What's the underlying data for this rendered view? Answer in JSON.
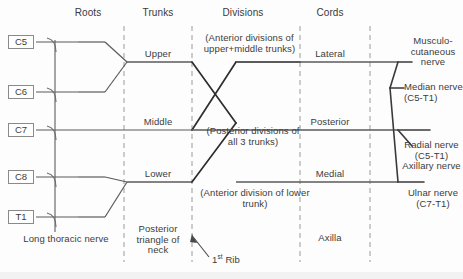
{
  "diagram": {
    "columns": [
      {
        "id": "roots",
        "label": "Roots",
        "x": 88
      },
      {
        "id": "trunks",
        "label": "Trunks",
        "x": 158
      },
      {
        "id": "divisions",
        "label": "Divisions",
        "x": 243
      },
      {
        "id": "cords",
        "label": "Cords",
        "x": 330
      }
    ],
    "roots": [
      {
        "label": "C5",
        "y": 35
      },
      {
        "label": "C6",
        "y": 85
      },
      {
        "label": "C7",
        "y": 123
      },
      {
        "label": "C8",
        "y": 170
      },
      {
        "label": "T1",
        "y": 210
      }
    ],
    "trunks": [
      {
        "label": "Upper",
        "x": 158,
        "y": 62
      },
      {
        "label": "Middle",
        "x": 158,
        "y": 123
      },
      {
        "label": "Lower",
        "x": 158,
        "y": 182
      }
    ],
    "cords": [
      {
        "label": "Lateral",
        "x": 330,
        "y": 62
      },
      {
        "label": "Posterior",
        "x": 330,
        "y": 123
      },
      {
        "label": "Medial",
        "x": 330,
        "y": 182
      }
    ],
    "division_notes": [
      {
        "id": "anterior-upper-middle",
        "text": "(Anterior divisions of upper+middle trunks)",
        "x": 247,
        "y": 38
      },
      {
        "id": "posterior-all-three",
        "text": "(Posterior divisions of all 3 trunks)",
        "x": 253,
        "y": 128
      },
      {
        "id": "anterior-lower",
        "text": "(Anterior division of lower trunk)",
        "x": 253,
        "y": 190
      }
    ],
    "terminal_nerves": [
      {
        "id": "musculocutaneous",
        "text": "Musculo-cutaneous nerve",
        "x": 429,
        "y": 40
      },
      {
        "id": "median",
        "text": "Median nerve (C5-T1)",
        "x": 429,
        "y": 84
      },
      {
        "id": "radial-axillary",
        "text": "Radial nerve (C5-T1) Axillary nerve",
        "x": 429,
        "y": 140
      },
      {
        "id": "ulnar",
        "text": "Ulnar nerve (C7-T1)",
        "x": 429,
        "y": 190
      }
    ],
    "annotations": [
      {
        "id": "long-thoracic-nerve",
        "text": "Long thoracic nerve",
        "x": 58,
        "y": 240
      },
      {
        "id": "posterior-triangle",
        "text": "Posterior triangle of neck",
        "x": 158,
        "y": 228
      },
      {
        "id": "first-rib",
        "text": "1st Rib",
        "prefix": "1",
        "sup": "st",
        "suffix": " Rib",
        "x": 208,
        "y": 248
      },
      {
        "id": "axilla",
        "text": "Axilla",
        "x": 330,
        "y": 238
      }
    ],
    "colors": {
      "line": "#5a5a5a",
      "line_bold": "#2e2e2e",
      "dashed": "#9a9a9a",
      "text": "#3c3c3c",
      "box_border": "#8a8a8a",
      "background": "#fdfdfd"
    },
    "dashed_guides": [
      124,
      192,
      300,
      370
    ]
  }
}
